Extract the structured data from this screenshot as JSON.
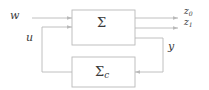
{
  "figure": {
    "kind": "block-diagram",
    "stroke_color": "#b9b9b9",
    "text_color": "#3a3a3a",
    "background": "#ffffff"
  },
  "blocks": [
    {
      "id": "plant",
      "label": "Σ",
      "label_base": "Σ",
      "label_sub": "",
      "x": 72,
      "y": 10,
      "w": 63,
      "h": 35
    },
    {
      "id": "controller",
      "label": "Σc",
      "label_base": "Σ",
      "label_sub": "c",
      "x": 72,
      "y": 57,
      "w": 63,
      "h": 30
    }
  ],
  "signals": [
    {
      "id": "w",
      "label": "w",
      "label_base": "w",
      "label_sub": "",
      "role": "exogenous-input"
    },
    {
      "id": "u",
      "label": "u",
      "label_base": "u",
      "label_sub": "",
      "role": "control-input"
    },
    {
      "id": "y",
      "label": "y",
      "label_base": "y",
      "label_sub": "",
      "role": "measured-output"
    },
    {
      "id": "z0",
      "label": "z0",
      "label_base": "z",
      "label_sub": "0",
      "role": "performance-output"
    },
    {
      "id": "z1",
      "label": "z1",
      "label_base": "z",
      "label_sub": "1",
      "role": "performance-output"
    }
  ]
}
